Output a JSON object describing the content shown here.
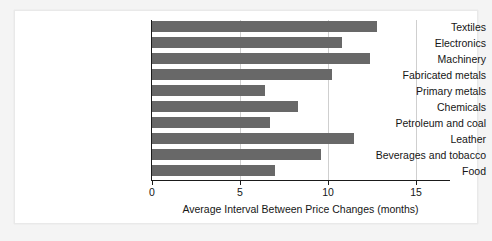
{
  "chart_data": {
    "type": "bar",
    "orientation": "horizontal",
    "title": "",
    "subtitle": "",
    "xlabel": "Average Interval Between Price Changes (months)",
    "ylabel": "",
    "categories": [
      "Textiles",
      "Electronics",
      "Machinery",
      "Fabricated metals",
      "Primary metals",
      "Chemicals",
      "Petroleum and coal",
      "Leather",
      "Beverages and tobacco",
      "Food"
    ],
    "values": [
      12.8,
      10.8,
      12.4,
      10.2,
      6.4,
      8.3,
      6.7,
      11.5,
      9.6,
      7.0
    ],
    "xlim": [
      0,
      17.2
    ],
    "xticks": [
      0,
      5,
      10,
      15
    ],
    "xtick_labels": [
      "0",
      "5",
      "10",
      "15"
    ],
    "grid": "vertical",
    "legend": "none",
    "bar_color": "#686868",
    "axis_color": "#1a1a1a",
    "gridline_color": "#cfcfcf",
    "plot_background": "#ffffff",
    "figure_background": "#f4f4f4"
  }
}
